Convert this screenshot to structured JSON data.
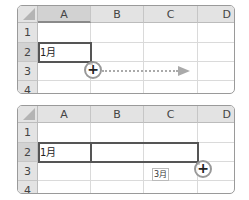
{
  "panels": [
    {
      "columns": [
        "A",
        "B",
        "C",
        "D"
      ],
      "rows": [
        "1",
        "2",
        "3",
        "4"
      ],
      "selected_column": "A",
      "selected_row": "2",
      "cells": {
        "A2": "1月"
      },
      "cursor_symbol": "+"
    },
    {
      "columns": [
        "A",
        "B",
        "C",
        "D"
      ],
      "rows": [
        "1",
        "2",
        "3",
        "4"
      ],
      "selected_row": "2",
      "cells": {
        "A2": "1月"
      },
      "tooltip": "3月",
      "cursor_symbol": "+"
    }
  ],
  "colors": {
    "header_bg": "#e3e3e3",
    "selection_border": "#555555",
    "arrow": "#aaaaaa"
  }
}
